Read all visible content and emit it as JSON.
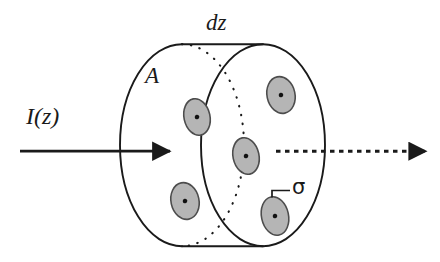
{
  "figure": {
    "type": "physics-schematic",
    "background_color": "#ffffff",
    "line_color": "#1a1a1a",
    "particle_fill_color": "#b3b3b3",
    "particle_stroke_color": "#4d4d4d",
    "particle_dot_color": "#111111"
  },
  "labels": {
    "thickness": "dz",
    "area": "A",
    "intensity": "I(z)",
    "cross_section": "σ"
  },
  "annotations": {
    "incoming_beam": "solid-arrow-right",
    "outgoing_beam": "dashed-arrow-right",
    "hidden_edge": "dotted-ellipse-arc",
    "leader_line": "sigma-leader"
  },
  "geometry": {
    "front_face": {
      "cx": 182,
      "cy": 145,
      "rx": 62,
      "ry": 101
    },
    "back_face": {
      "cx": 263,
      "cy": 145,
      "rx": 62,
      "ry": 101
    },
    "particles": [
      {
        "cx": 197,
        "cy": 117,
        "rx": 13,
        "ry": 18,
        "rot": -12
      },
      {
        "cx": 185,
        "cy": 201,
        "rx": 14,
        "ry": 18,
        "rot": -12
      },
      {
        "cx": 246,
        "cy": 156,
        "rx": 13,
        "ry": 18,
        "rot": -12
      },
      {
        "cx": 281,
        "cy": 95,
        "rx": 14,
        "ry": 18,
        "rot": -12
      },
      {
        "cx": 275,
        "cy": 216,
        "rx": 13,
        "ry": 19,
        "rot": -12
      }
    ],
    "incoming_arrow": {
      "x1": 20,
      "y1": 151,
      "x2": 168,
      "y2": 151
    },
    "outgoing_arrow": {
      "x1": 276,
      "y1": 151,
      "x2": 424,
      "y2": 151
    }
  }
}
